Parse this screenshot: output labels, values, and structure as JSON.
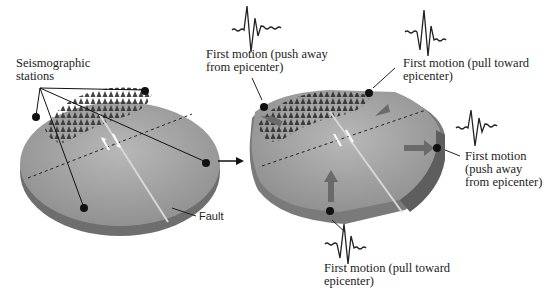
{
  "diagram": {
    "left_panel": {
      "stations_label": [
        "Seismographic",
        "stations"
      ],
      "fault_label": "Fault"
    },
    "transition_arrow": "right-arrow",
    "right_panel": {
      "annotations": [
        {
          "id": "top-left",
          "lines": [
            "First motion (push away",
            "from epicenter)"
          ],
          "motion": "push"
        },
        {
          "id": "top-right",
          "lines": [
            "First motion (pull toward",
            "epicenter)"
          ],
          "motion": "pull"
        },
        {
          "id": "right",
          "lines": [
            "First motion",
            "(push away",
            "from epicenter)"
          ],
          "motion": "push"
        },
        {
          "id": "bottom",
          "lines": [
            "First motion (pull toward",
            "epicenter)"
          ],
          "motion": "pull"
        }
      ]
    },
    "colors": {
      "ground": "#9a9a9a",
      "ground_light": "#b5b5b5",
      "edge": "#6e6e6e",
      "trees": "#3a3a3a",
      "arrow_gray": "#6a6a6a",
      "station": "#111111"
    }
  }
}
